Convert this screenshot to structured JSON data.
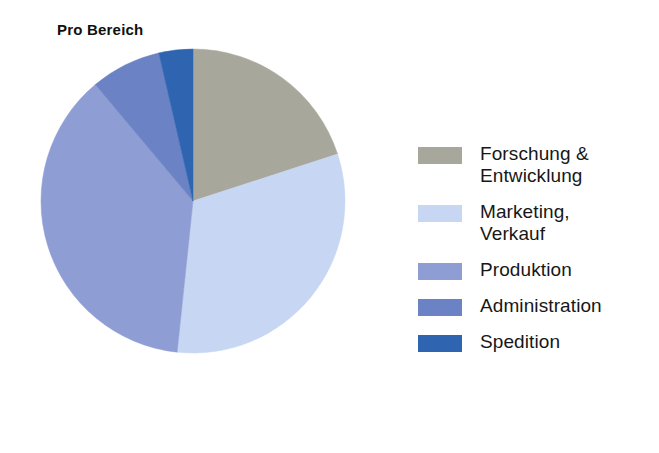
{
  "chart": {
    "title": "Pro Bereich"
  },
  "legend": {
    "items": [
      {
        "label": "Forschung &\nEntwicklung",
        "color": "#a8a79c",
        "name": "legend-item-forschung-entwicklung"
      },
      {
        "label": "Marketing,\nVerkauf",
        "color": "#c7d6f2",
        "name": "legend-item-marketing-verkauf"
      },
      {
        "label": "Produktion",
        "color": "#8e9dd4",
        "name": "legend-item-produktion"
      },
      {
        "label": "Administration",
        "color": "#6b82c4",
        "name": "legend-item-administration"
      },
      {
        "label": "Spedition",
        "color": "#2f65b0",
        "name": "legend-item-spedition"
      }
    ]
  },
  "chart_data": {
    "type": "pie",
    "title": "Pro Bereich",
    "xlabel": "",
    "ylabel": "",
    "legend_position": "right",
    "grid": false,
    "start_angle_deg": 0,
    "direction": "clockwise",
    "categories": [
      "Forschung & Entwicklung",
      "Marketing, Verkauf",
      "Produktion",
      "Administration",
      "Spedition"
    ],
    "values": [
      20,
      31.7,
      37.2,
      7.5,
      3.6
    ],
    "value_unit": "percent",
    "colors": [
      "#a8a79c",
      "#c7d6f2",
      "#8e9dd4",
      "#6b82c4",
      "#2f65b0"
    ],
    "slices": [
      {
        "label": "Forschung & Entwicklung",
        "value": 20.0,
        "color": "#a8a79c",
        "start_deg": 0,
        "end_deg": 72
      },
      {
        "label": "Marketing, Verkauf",
        "value": 31.7,
        "color": "#c7d6f2",
        "start_deg": 72,
        "end_deg": 186
      },
      {
        "label": "Produktion",
        "value": 37.2,
        "color": "#8e9dd4",
        "start_deg": 186,
        "end_deg": 320
      },
      {
        "label": "Administration",
        "value": 7.5,
        "color": "#6b82c4",
        "start_deg": 320,
        "end_deg": 347
      },
      {
        "label": "Spedition",
        "value": 3.6,
        "color": "#2f65b0",
        "start_deg": 347,
        "end_deg": 360
      }
    ],
    "geometry": {
      "cx": 155,
      "cy": 157,
      "r": 152
    }
  }
}
